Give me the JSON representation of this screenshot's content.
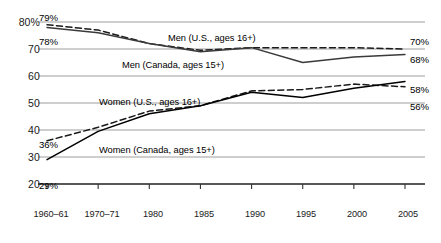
{
  "chart_data": {
    "type": "line",
    "title": "",
    "subtitle": "",
    "xlabel": "",
    "ylabel": "",
    "grid": true,
    "legend_position": "inline-annotations",
    "categories": [
      "1960–61",
      "1970–71",
      "1980",
      "1985",
      "1990",
      "1995",
      "2000",
      "2005"
    ],
    "x_positions": [
      0,
      1,
      2,
      3,
      4,
      5,
      6,
      7
    ],
    "xlim": [
      0,
      7
    ],
    "ylim": [
      20,
      80
    ],
    "yticks": [
      20,
      30,
      40,
      50,
      60,
      70,
      80
    ],
    "ytick_labels": [
      "20",
      "30",
      "40",
      "50",
      "60",
      "70",
      "80%"
    ],
    "series": [
      {
        "name": "Men (U.S., ages 16+)",
        "style": "dashed",
        "color": "#1a1a1a",
        "values": [
          79,
          77,
          72,
          69.5,
          70.5,
          70.5,
          70.5,
          70
        ]
      },
      {
        "name": "Men (Canada, ages 15+)",
        "style": "solid",
        "color": "#3a3a3a",
        "values": [
          78,
          76,
          72,
          69,
          70.5,
          65,
          67,
          68
        ]
      },
      {
        "name": "Women (U.S., ages 16+)",
        "style": "dashed",
        "color": "#1a1a1a",
        "values": [
          36,
          41,
          47,
          49,
          54.5,
          55,
          57,
          56
        ]
      },
      {
        "name": "Women (Canada, ages 15+)",
        "style": "solid",
        "color": "#000000",
        "values": [
          29,
          39.5,
          46,
          49,
          54,
          52,
          55.5,
          58
        ]
      }
    ],
    "annotations": [
      {
        "text": "79%",
        "series": "Men (U.S., ages 16+)",
        "position": "start"
      },
      {
        "text": "78%",
        "series": "Men (Canada, ages 15+)",
        "position": "start"
      },
      {
        "text": "36%",
        "series": "Women (U.S., ages 16+)",
        "position": "start"
      },
      {
        "text": "29%",
        "series": "Women (Canada, ages 15+)",
        "position": "start"
      },
      {
        "text": "70%",
        "series": "Men (U.S., ages 16+)",
        "position": "end"
      },
      {
        "text": "68%",
        "series": "Men (Canada, ages 15+)",
        "position": "end"
      },
      {
        "text": "58%",
        "series": "Women (Canada, ages 15+)",
        "position": "end"
      },
      {
        "text": "56%",
        "series": "Women (U.S., ages 16+)",
        "position": "end"
      }
    ]
  },
  "axis": {
    "y_labels": [
      "80%",
      "70",
      "60",
      "50",
      "40",
      "30",
      "20"
    ],
    "x_labels": [
      "1960–61",
      "1970–71",
      "1980",
      "1985",
      "1990",
      "1995",
      "2000",
      "2005"
    ]
  },
  "series_labels": {
    "men_us": "Men (U.S., ages 16+)",
    "men_canada": "Men (Canada, ages 15+)",
    "women_us": "Women (U.S., ages 16+)",
    "women_canada": "Women (Canada, ages 15+)"
  },
  "endpoints": {
    "men_us_start": "79%",
    "men_canada_start": "78%",
    "women_us_start": "36%",
    "women_canada_start": "29%",
    "men_us_end": "70%",
    "men_canada_end": "68%",
    "women_canada_end": "58%",
    "women_us_end": "56%"
  },
  "colors": {
    "gridline": "#8c8c8c",
    "axis": "#333333",
    "line_dark": "#000000",
    "line_gray": "#3a3a3a",
    "text": "#1a1a1a"
  }
}
